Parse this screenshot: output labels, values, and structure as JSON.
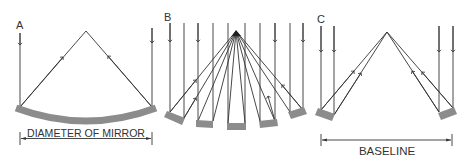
{
  "diagram": {
    "type": "telescope-mirror-comparison",
    "colors": {
      "line": "#333333",
      "mirror": "#8c8c8c",
      "background": "#ffffff"
    },
    "panels": [
      {
        "id": "A",
        "label": "A",
        "description": "Single large curved mirror focusing parallel rays",
        "dimension_label": "DIAMETER OF MIRROR"
      },
      {
        "id": "B",
        "label": "B",
        "description": "Segmented mirror of five tilted segments focusing rays to one point"
      },
      {
        "id": "C",
        "label": "C",
        "description": "Two separated mirrors (interferometer) combining rays",
        "dimension_label": "BASELINE"
      }
    ]
  }
}
